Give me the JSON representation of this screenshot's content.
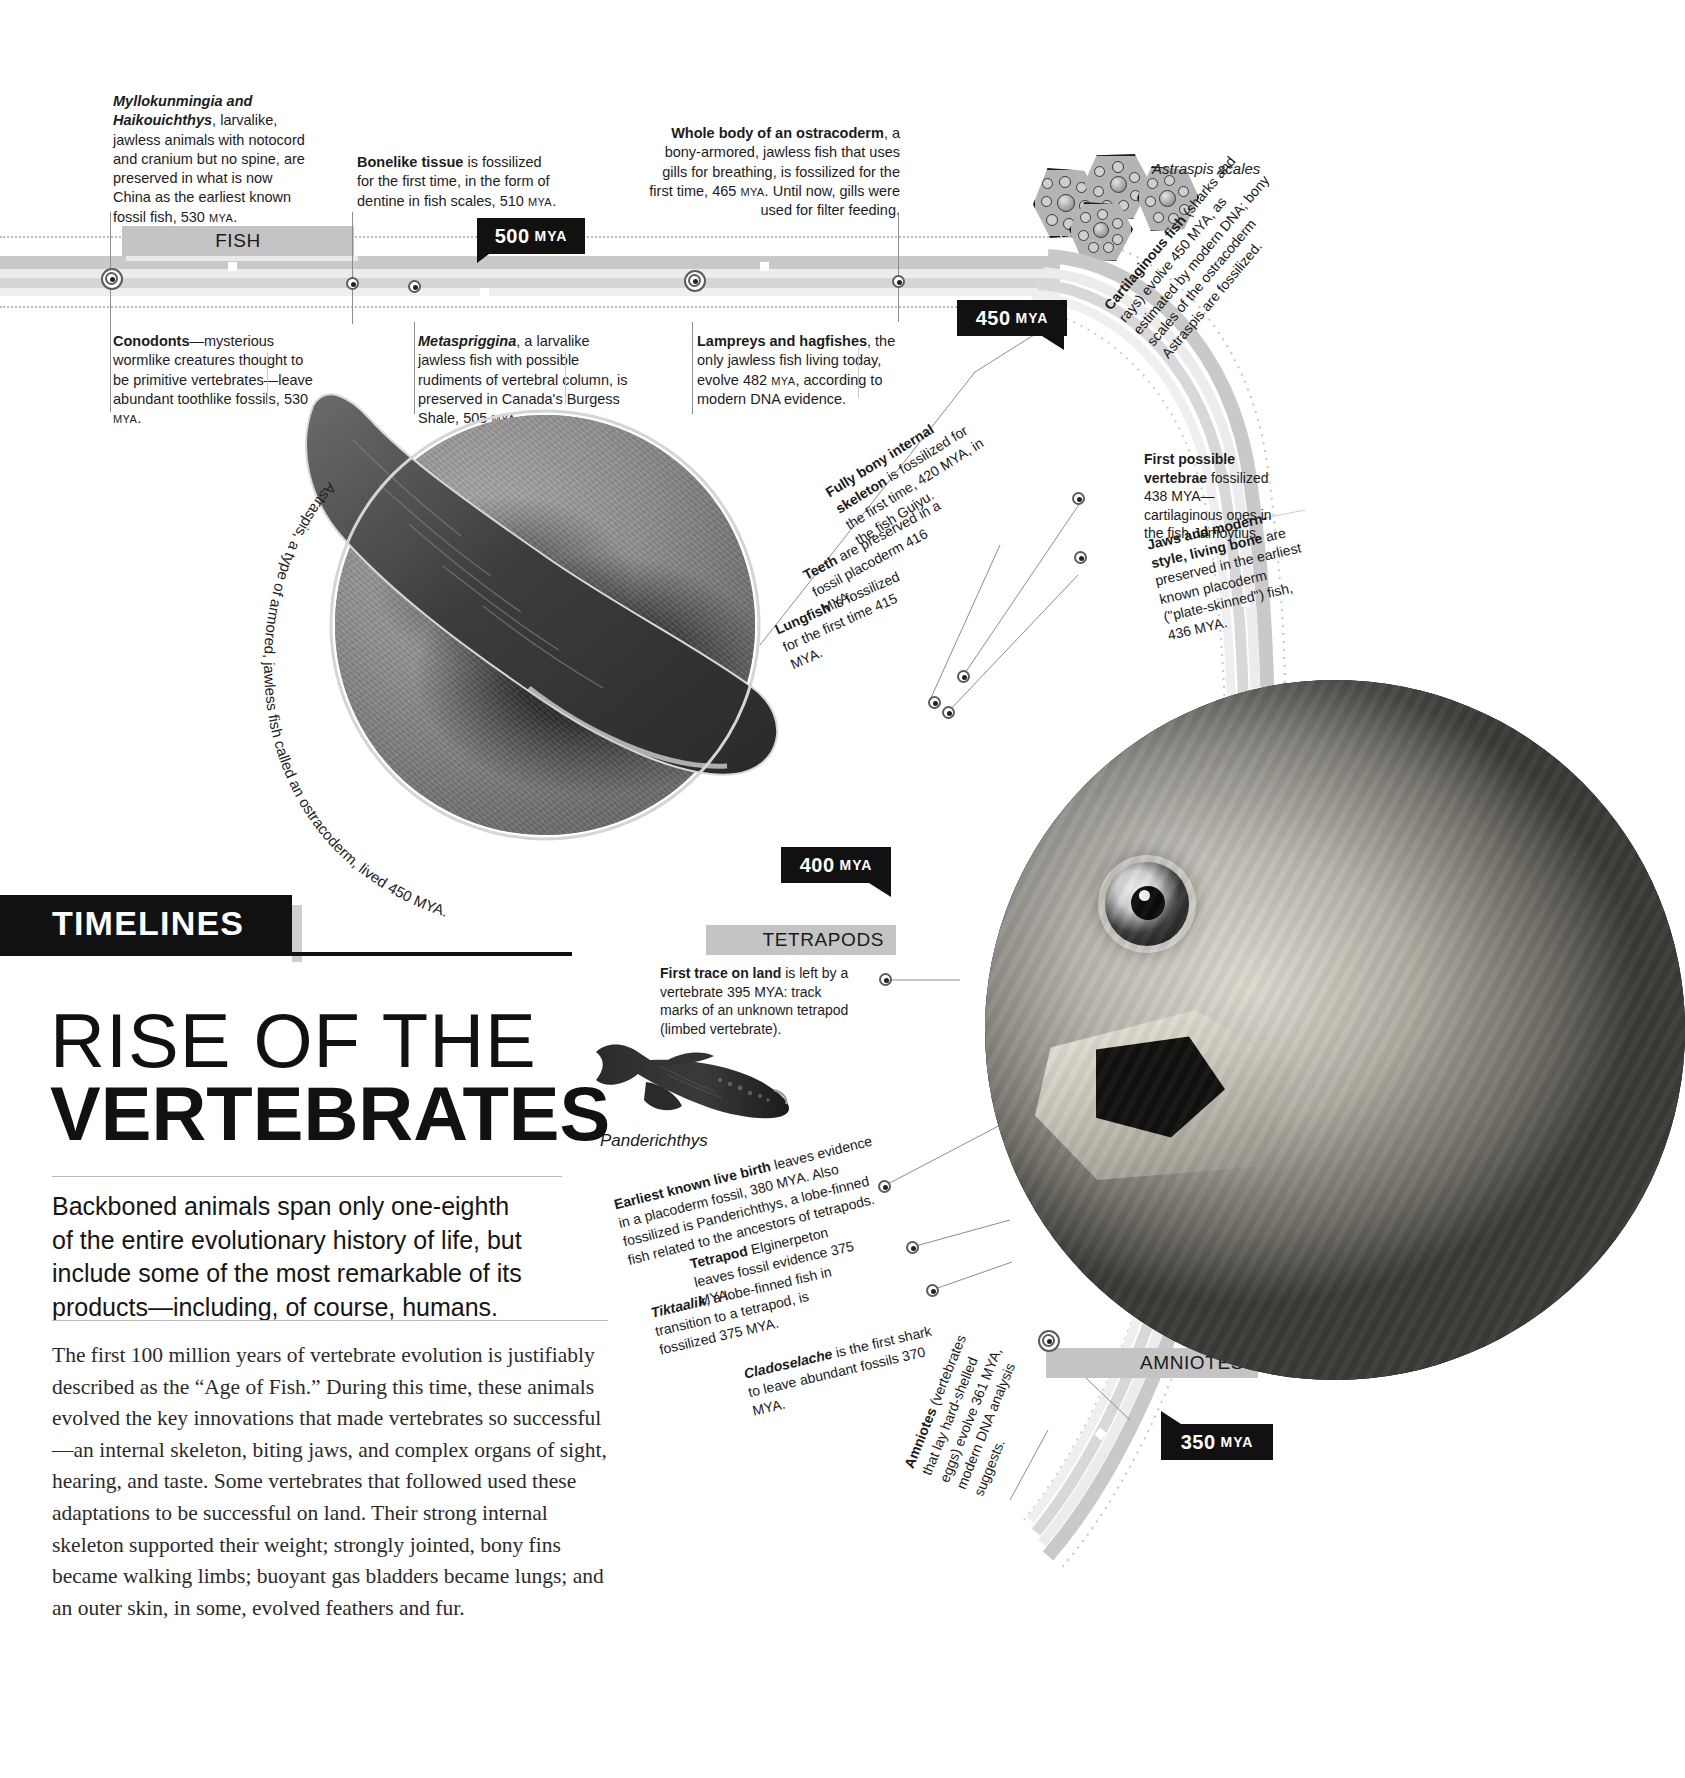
{
  "masthead": {
    "kicker": "TIMELINES",
    "title_line1": "RISE OF THE",
    "title_line2": "VERTEBRATES",
    "deck": "Backboned animals span only one-eighth of the entire evolutionary history of life, but include some of the most remarkable of its products—including, of course, humans.",
    "body": "The first 100 million years of vertebrate evolution is justifiably described as the “Age of Fish.” During this time, these animals evolved the key innovations that made vertebrates so successful—an internal skeleton, biting jaws, and complex organs of sight, hearing, and taste. Some vertebrates that followed used these adaptations to be successful on land. Their strong internal skeleton supported their weight; strongly jointed, bony fins became walking limbs; buoyant gas bladders became lungs; and an outer skin, in some, evolved feathers and fur."
  },
  "eras": [
    {
      "label": "FISH"
    },
    {
      "label": "TETRAPODS"
    },
    {
      "label": "AMNIOTES"
    }
  ],
  "markers": [
    {
      "value": "500",
      "unit": "MYA"
    },
    {
      "value": "450",
      "unit": "MYA"
    },
    {
      "value": "400",
      "unit": "MYA"
    },
    {
      "value": "350",
      "unit": "MYA"
    }
  ],
  "annotations_top": [
    {
      "id": "myllokunmingia",
      "lead": "Myllokunmingia and Haikouichthys",
      "rest": ", larvalike, jawless animals with notocord and cranium but no spine, are preserved in what is now China as the earliest known fossil fish, 530 ",
      "unit": "MYA",
      "tail": "."
    },
    {
      "id": "bonelike-tissue",
      "lead": "Bonelike tissue",
      "rest": " is fossilized for the first time, in the form of dentine in fish scales, 510 ",
      "unit": "MYA",
      "tail": "."
    },
    {
      "id": "ostracoderm-body",
      "lead": "Whole body of an ostracoderm",
      "rest": ", a bony-armored, jawless fish that uses gills for breathing, is fossilized for the first time, 465 ",
      "unit": "MYA",
      "tail": ". Until now, gills were used for filter feeding."
    }
  ],
  "annotations_below": [
    {
      "id": "conodonts",
      "lead": "Conodonts",
      "rest": "—mysterious wormlike creatures thought to be primitive vertebrates—leave abundant toothlike fossils, 530 ",
      "unit": "MYA",
      "tail": "."
    },
    {
      "id": "metaspriggina",
      "lead": "Metaspriggina",
      "rest": ", a larvalike jawless fish with possible rudiments of vertebral column, is preserved in Canada's Burgess Shale, 505 ",
      "unit": "MYA",
      "tail": "."
    },
    {
      "id": "lampreys-hagfishes",
      "lead": "Lampreys and hagfishes",
      "rest": ", the only jawless fish living today, evolve 482 ",
      "unit": "MYA",
      "tail": ", according to modern DNA evidence."
    }
  ],
  "annotations_arc": [
    {
      "id": "cartilaginous-fish",
      "lead": "Cartilaginous fish",
      "rest": " (sharks and rays) evolve 450 MYA, as estimated by modern DNA; bony scales of the ostracoderm Astraspis are fossilized."
    },
    {
      "id": "first-possible-vertebrae",
      "lead": "First possible vertebrae",
      "rest": " fossilized 438 MYA— cartilaginous ones in the fish Jamoytius."
    },
    {
      "id": "jaws-and-modern-bone",
      "lead": "Jaws and modern-style, living bone",
      "rest": " are preserved in the earliest known placoderm (\"plate-skinned\") fish, 436 MYA."
    },
    {
      "id": "fully-bony-skeleton",
      "lead": "Fully bony internal skeleton",
      "rest": " is fossilized for the first time, 420 MYA, in the fish Guiyu."
    },
    {
      "id": "teeth",
      "lead": "Teeth",
      "rest": " are preserved in a fossil placoderm 416 MYA."
    },
    {
      "id": "lungfish",
      "lead": "Lungfish",
      "rest": " is fossilized for the first time 415 MYA."
    },
    {
      "id": "first-trace-on-land",
      "lead": "First trace on land",
      "rest": " is left by a vertebrate 395 MYA: track marks of an unknown tetrapod (limbed vertebrate)."
    },
    {
      "id": "earliest-live-birth",
      "lead": "Earliest known live birth",
      "rest": " leaves evidence in a placoderm fossil, 380 MYA. Also fossilized is Panderichthys, a lobe-finned fish related to the ancestors of tetrapods."
    },
    {
      "id": "tetrapod-elginerpeton",
      "lead": "Tetrapod",
      "rest": " Elginerpeton leaves fossil evidence 375 MYA."
    },
    {
      "id": "tiktaalik",
      "lead": "Tiktaalik",
      "rest": ", a lobe-finned fish in transition to a tetrapod, is fossilized 375 MYA."
    },
    {
      "id": "cladoselache",
      "lead": "Cladoselache",
      "rest": " is the first shark to leave abundant fossils 370 MYA."
    },
    {
      "id": "amniotes",
      "lead": "Amniotes",
      "rest": " (vertebrates that lay hard-shelled eggs) evolve 361 MYA, modern DNA analysis suggests."
    }
  ],
  "captions": {
    "astraspis_scales": "Astraspis scales",
    "astraspis_circle": "Astraspis, a type of armored, jawless fish called an ostracoderm, lived 450 MYA.",
    "panderichthys": "Panderichthys"
  },
  "colors": {
    "ink": "#111111",
    "band_dark": "#c4c4c4",
    "band_mid": "#d6d6d6",
    "band_light": "#e6e6e6",
    "rule": "#8d8d8d"
  }
}
